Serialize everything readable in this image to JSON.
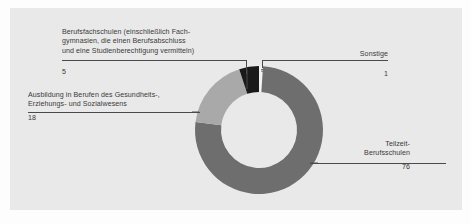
{
  "figure": {
    "background_color": "#e9e9e9",
    "page_color": "#fdfdfd"
  },
  "chart_data": {
    "type": "pie",
    "variant": "donut",
    "title": "",
    "subtitle": "",
    "xlabel": "",
    "ylabel": "",
    "unit": "%",
    "total": 100,
    "legend_position": "callout-labels",
    "grid": false,
    "categories": [
      "Teilzeit-Berufsschulen",
      "Ausbildung in Berufen des Gesundheits-, Erziehungs- und Sozialwesens",
      "Berufsfachschulen (einschließlich Fachgymnasien, die einen Berufsabschluss und eine Studienberechtigung vermitteln)",
      "Sonstige"
    ],
    "values": [
      76,
      18,
      5,
      1
    ],
    "colors": [
      "#6e6e6e",
      "#a9a9a9",
      "#1a1a1a",
      "#f2f2f2"
    ],
    "slices": [
      {
        "name": "Teilzeit-Berufsschulen",
        "value": 76,
        "color": "#6e6e6e",
        "start_angle_deg": 21.6,
        "end_angle_deg": 295.2
      },
      {
        "name": "Ausbildung in Berufen des Gesundheits-, Erziehungs- und Sozialwesens",
        "value": 18,
        "color": "#a9a9a9",
        "start_angle_deg": 295.2,
        "end_angle_deg": 352.8
      },
      {
        "name": "Berufsfachschulen (einschließlich Fachgymnasien, die einen Berufsabschluss und eine Studienberechtigung vermitteln)",
        "value": 5,
        "color": "#1a1a1a",
        "start_angle_deg": 352.8,
        "end_angle_deg": 18.0
      },
      {
        "name": "Sonstige",
        "value": 1,
        "color": "#f2f2f2",
        "start_angle_deg": 18.0,
        "end_angle_deg": 21.6
      }
    ]
  },
  "callouts": {
    "berufsfachschulen": {
      "label": "Berufsfachschulen (einschließlich Fach-\ngymnasien, die einen Berufsabschluss\nund eine Studienberechtigung vermitteln)",
      "value": "5"
    },
    "sonstige": {
      "label": "Sonstige",
      "value": "1"
    },
    "ausbildung": {
      "label": "Ausbildung in Berufen des Gesundheits-,\nErziehungs- und Sozialwesens",
      "value": "18"
    },
    "teilzeit": {
      "label": "Teilzeit-\nBerufsschulen",
      "value": "76"
    }
  }
}
